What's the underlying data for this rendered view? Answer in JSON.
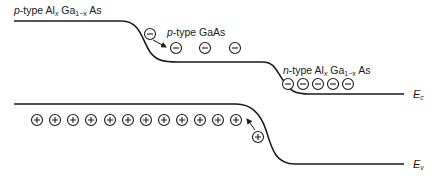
{
  "labels": {
    "left_region": {
      "type_prefix": "p",
      "type_suffix": "-type Al",
      "sub_x": "x",
      "mid": " Ga",
      "sub_1x": "1−x",
      "end": " As"
    },
    "middle_region": {
      "type_prefix": "p",
      "type_suffix": "-type GaAs"
    },
    "right_region": {
      "type_prefix": "n",
      "type_suffix": "-type Al",
      "sub_x": "x",
      "mid": " Ga",
      "sub_1x": "1−x",
      "end": " As"
    },
    "conduction_band": {
      "letter": "E",
      "sub": "c"
    },
    "valence_band": {
      "letter": "E",
      "sub": "v"
    }
  },
  "carriers": {
    "electron_symbol": "−",
    "hole_symbol": "+",
    "electrons_middle_count": 3,
    "electron_injected_count": 1,
    "electrons_right_count": 5,
    "holes_left_count": 12,
    "hole_injected_count": 1
  },
  "colors": {
    "line": "#1a1a1a",
    "background": "#ffffff"
  }
}
